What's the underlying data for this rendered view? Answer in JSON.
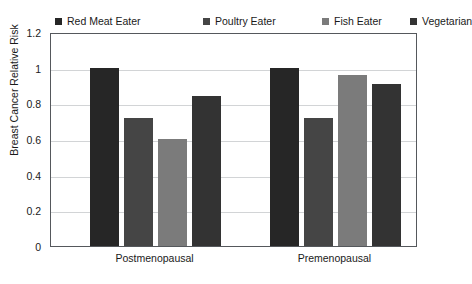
{
  "chart_data": {
    "type": "bar",
    "title": "",
    "xlabel": "",
    "ylabel": "Breast Cancer Relative Risk",
    "categories": [
      "Postmenopausal",
      "Premenopausal"
    ],
    "ylim": [
      0,
      1.2
    ],
    "yticks": [
      "0",
      "0.2",
      "0.4",
      "0.6",
      "0.8",
      "1",
      "1.2"
    ],
    "ytick_values": [
      0,
      0.2,
      0.4,
      0.6,
      0.8,
      1,
      1.2
    ],
    "grid": true,
    "legend_position": "top",
    "series": [
      {
        "name": "Red Meat Eater",
        "color": "#262626",
        "values": [
          1.0,
          1.0
        ]
      },
      {
        "name": "Poultry Eater",
        "color": "#454545",
        "values": [
          0.72,
          0.72
        ]
      },
      {
        "name": "Fish Eater",
        "color": "#7b7b7b",
        "values": [
          0.6,
          0.96
        ]
      },
      {
        "name": "Vegetarian",
        "color": "#333333",
        "values": [
          0.84,
          0.91
        ]
      }
    ]
  },
  "legend": {
    "items": [
      {
        "label": "Red Meat Eater"
      },
      {
        "label": "Poultry Eater"
      },
      {
        "label": "Fish Eater"
      },
      {
        "label": "Vegetarian"
      }
    ]
  }
}
